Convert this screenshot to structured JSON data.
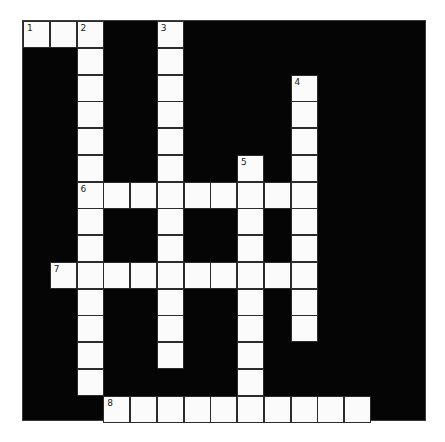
{
  "puzzle": {
    "rows": 15,
    "cols": 15,
    "colors": {
      "block": "#050505",
      "cell": "#fbfbfb",
      "border": "#2b2b2b",
      "number": "#222222"
    },
    "words": [
      {
        "number": "1",
        "direction": "across",
        "row": 0,
        "col": 0,
        "length": 3
      },
      {
        "number": "2",
        "direction": "down",
        "row": 0,
        "col": 2,
        "length": 14
      },
      {
        "number": "3",
        "direction": "down",
        "row": 0,
        "col": 5,
        "length": 13
      },
      {
        "number": "4",
        "direction": "down",
        "row": 2,
        "col": 10,
        "length": 10
      },
      {
        "number": "5",
        "direction": "down",
        "row": 5,
        "col": 8,
        "length": 10
      },
      {
        "number": "6",
        "direction": "across",
        "row": 6,
        "col": 2,
        "length": 9
      },
      {
        "number": "7",
        "direction": "across",
        "row": 9,
        "col": 1,
        "length": 10
      },
      {
        "number": "8",
        "direction": "across",
        "row": 14,
        "col": 3,
        "length": 10
      }
    ]
  }
}
